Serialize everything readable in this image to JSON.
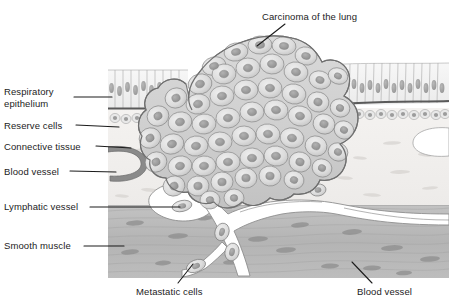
{
  "figure": {
    "background_color": "#ffffff",
    "label_color": "#1c1c1c",
    "leader_line_color": "#1c1c1c"
  },
  "labels": {
    "respiratory_epithelium": "Respiratory\nepithelium",
    "reserve_cells": "Reserve cells",
    "connective_tissue": "Connective tissue",
    "blood_vessel_left": "Blood vessel",
    "lymphatic_vessel": "Lymphatic vessel",
    "smooth_muscle": "Smooth muscle",
    "carcinoma": "Carcinoma of the lung",
    "metastatic_cells": "Metastatic cells",
    "blood_vessel_bottom": "Blood vessel"
  },
  "diagram": {
    "type": "histology-cross-section",
    "layers": [
      {
        "name": "respiratory-epithelium",
        "description": "Pseudostratified columnar cells with oval nuclei along the luminal surface",
        "fill": "#f2f2f2",
        "stroke": "#9a9a9a",
        "y_top": 62,
        "y_bottom": 108
      },
      {
        "name": "basement-membrane",
        "description": "Dark line separating epithelium from underlying tissue",
        "stroke": "#595959",
        "y": 108
      },
      {
        "name": "reserve-cells",
        "description": "Row of small rounded basal cells beneath the basement membrane",
        "fill": "#ececec",
        "stroke": "#a2a2a2",
        "y_top": 108,
        "y_bottom": 128
      },
      {
        "name": "connective-tissue",
        "description": "Pale fibrous stroma containing blood vessels",
        "fill": "#f6f4f2",
        "stroke": "#b9b9b9",
        "y_top": 128,
        "y_bottom": 205
      },
      {
        "name": "smooth-muscle",
        "description": "Darker grey band of elongated spindle-shaped muscle cells",
        "fill": "#b9b9b9",
        "stroke": "#8e8e8e",
        "y_top": 205,
        "y_bottom": 278
      }
    ],
    "tumor": {
      "name": "carcinoma-mass",
      "description": "Large lobulated mass of polygonal tumour cells with prominent nuclei, breaking through epithelium and invading downward",
      "fill": "#d6d6d6",
      "cell_fill": "#dcdcdc",
      "nucleus_fill": "#9e9e9e",
      "stroke": "#7d7d7d"
    },
    "vessels": [
      {
        "name": "blood-vessel-connective-tissue",
        "description": "C-shaped vessel lumen in the connective tissue at left",
        "lumen": "#ffffff",
        "wall": "#6f6f6f"
      },
      {
        "name": "lymphatic-vessel",
        "description": "Wide white lymphatic lumen containing a detached tumour cell",
        "lumen": "#ffffff",
        "wall": "#8a8a8a"
      },
      {
        "name": "blood-vessel-muscle",
        "description": "Branching vessels coursing through the smooth muscle carrying metastatic cells",
        "lumen": "#ffffff",
        "wall": "#8a8a8a"
      }
    ],
    "metastatic_cells": {
      "count": 6,
      "description": "Spindle/oval tumour cells free within vessel lumens",
      "fill": "#cfcfcf",
      "nucleus_fill": "#949494"
    }
  }
}
